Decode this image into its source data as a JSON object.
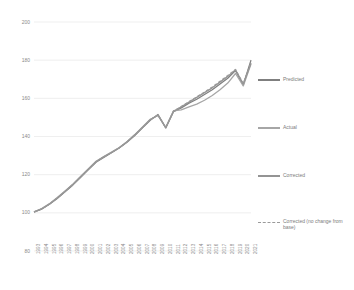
{
  "chart": {
    "type": "line",
    "title": "",
    "xlabel": "",
    "ylabel": "",
    "grid": true,
    "legend_position": "right"
  },
  "axis": {
    "y_ticks": [
      "200",
      "180",
      "160",
      "140",
      "120",
      "100",
      "80"
    ],
    "y_min": 80,
    "y_max": 200
  },
  "legend": {
    "items": [
      {
        "label": "Predicted",
        "color": "#7f7f7f",
        "style": "solid"
      },
      {
        "label": "Actual",
        "color": "#a6a6a6",
        "style": "solid"
      },
      {
        "label": "Corrected",
        "color": "#949494",
        "style": "solid"
      },
      {
        "label": "Corrected (no change from base)",
        "color": "#9a9a9a",
        "style": "dashed"
      }
    ]
  },
  "chart_data": {
    "type": "line",
    "title": "",
    "xlabel": "",
    "ylabel": "",
    "grid": true,
    "legend_position": "right",
    "ylim": [
      80,
      200
    ],
    "yticks": [
      80,
      100,
      120,
      140,
      160,
      180,
      200
    ],
    "categories": [
      "1993",
      "1994",
      "1995",
      "1996",
      "1997",
      "1998",
      "1999",
      "2000",
      "2001",
      "2002",
      "2003",
      "2004",
      "2005",
      "2006",
      "2007",
      "2008",
      "2009",
      "2010",
      "2011",
      "2012",
      "2013",
      "2014",
      "2015",
      "2016",
      "2017",
      "2018",
      "2019",
      "2020",
      "2021"
    ],
    "series": [
      {
        "name": "Predicted",
        "color": "#7f7f7f",
        "style": "solid",
        "values": [
          100.5,
          102.0,
          104.5,
          107.5,
          111.0,
          114.5,
          118.5,
          122.5,
          126.5,
          129.0,
          131.5,
          134.0,
          137.0,
          140.5,
          144.5,
          148.5,
          151.5,
          144.5,
          153.0,
          155.0,
          157.5,
          159.5,
          162.0,
          164.5,
          167.5,
          170.5,
          174.5,
          167.0,
          180.0
        ]
      },
      {
        "name": "Actual",
        "color": "#a6a6a6",
        "style": "solid",
        "values": [
          100.5,
          102.2,
          104.8,
          108.0,
          111.5,
          115.0,
          119.0,
          123.0,
          127.0,
          129.5,
          131.8,
          134.2,
          137.3,
          141.0,
          145.0,
          149.0,
          151.0,
          144.8,
          153.5,
          154.0,
          155.5,
          157.0,
          159.0,
          161.5,
          164.5,
          168.0,
          173.0,
          166.5,
          178.0
        ]
      },
      {
        "name": "Corrected",
        "color": "#949494",
        "style": "solid",
        "values": [
          100.4,
          102.1,
          104.6,
          107.8,
          111.2,
          114.8,
          118.8,
          122.8,
          126.8,
          129.3,
          131.6,
          134.1,
          137.2,
          140.8,
          144.8,
          148.8,
          151.2,
          144.6,
          153.2,
          155.5,
          158.0,
          160.5,
          163.0,
          165.5,
          168.5,
          171.5,
          175.0,
          167.5,
          178.5
        ]
      },
      {
        "name": "Corrected (no change from base)",
        "color": "#9a9a9a",
        "style": "dashed",
        "values": [
          100.4,
          102.1,
          104.6,
          107.8,
          111.2,
          114.8,
          118.8,
          122.8,
          126.8,
          129.3,
          131.6,
          134.1,
          137.2,
          140.8,
          144.8,
          148.8,
          151.3,
          144.6,
          153.3,
          155.8,
          158.3,
          160.8,
          163.3,
          166.0,
          169.0,
          172.0,
          175.2,
          167.8,
          178.8
        ]
      }
    ]
  }
}
